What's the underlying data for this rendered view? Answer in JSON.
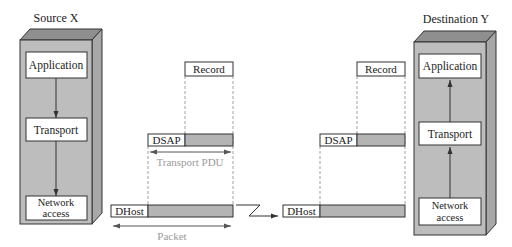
{
  "colors": {
    "box_front": "#bdbdbd",
    "box_top": "#8f8f8f",
    "box_side": "#a8a8a8",
    "field_fill": "#b4b4b4",
    "stroke": "#333333",
    "annotation": "#9a9a9a"
  },
  "source": {
    "title": "Source X",
    "layers": [
      {
        "label": "Application"
      },
      {
        "label": "Transport"
      },
      {
        "label_line1": "Network",
        "label_line2": "access"
      }
    ],
    "flow": "down"
  },
  "destination": {
    "title": "Destination Y",
    "layers": [
      {
        "label": "Application"
      },
      {
        "label": "Transport"
      },
      {
        "label_line1": "Network",
        "label_line2": "access"
      }
    ],
    "flow": "up"
  },
  "sender_units": {
    "record": "Record",
    "transport_header": "DSAP",
    "transport_span": "Transport PDU",
    "network_header": "DHost",
    "network_span": "Packet"
  },
  "receiver_units": {
    "record": "Record",
    "transport_header": "DSAP",
    "network_header": "DHost"
  },
  "link": {
    "symbol": "lightning-link-arrow"
  }
}
